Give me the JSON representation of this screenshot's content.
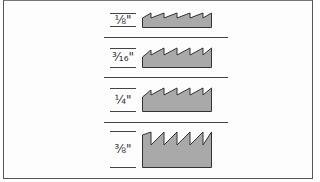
{
  "diagram": {
    "title": "",
    "fill_color": "#a9a9a9",
    "stroke_color": "#333333",
    "rows": [
      {
        "label": "1/8\"",
        "display": "⅛\"",
        "teeth": 5
      },
      {
        "label": "3/16\"",
        "display": "³⁄₁₆\"",
        "teeth": 5
      },
      {
        "label": "1/4\"",
        "display": "¼\"",
        "teeth": 5
      },
      {
        "label": "3/8\"",
        "display": "⅜\"",
        "teeth": 5
      }
    ]
  }
}
